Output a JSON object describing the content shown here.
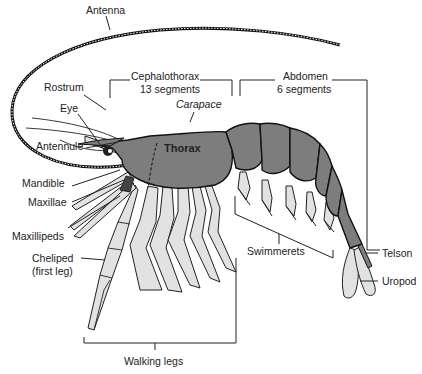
{
  "diagram": {
    "colors": {
      "body": "#7d7d7d",
      "appendage": "#e2e2e2",
      "outline": "#111111",
      "text": "#222222"
    },
    "labels": {
      "antenna": "Antenna",
      "cephalothorax": "Cephalothorax",
      "cephalothorax_segments": "13 segments",
      "abdomen": "Abdomen",
      "abdomen_segments": "6 segments",
      "rostrum": "Rostrum",
      "carapace": "Carapace",
      "eye": "Eye",
      "thorax": "Thorax",
      "antennule": "Antennule",
      "mandible": "Mandible",
      "maxillae": "Maxillae",
      "maxillipeds": "Maxillipeds",
      "cheliped": "Cheliped",
      "cheliped_note": "(first leg)",
      "swimmerets": "Swimmerets",
      "telson": "Telson",
      "uropod": "Uropod",
      "walking_legs": "Walking legs"
    }
  }
}
